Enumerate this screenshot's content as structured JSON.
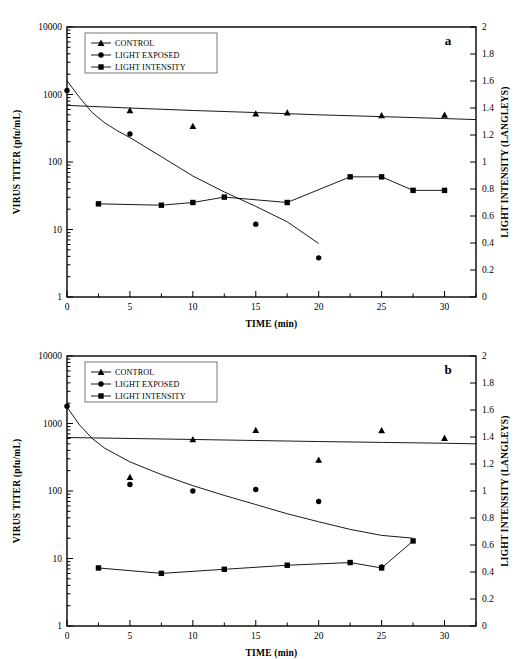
{
  "figure": {
    "panels": [
      {
        "id": "a",
        "letter": "a",
        "x_axis": {
          "title": "TIME (min)",
          "ticks": [
            0,
            5,
            10,
            15,
            20,
            25,
            30
          ],
          "min": 0,
          "max": 32.5,
          "minor_step": 2.5
        },
        "y_axis_left": {
          "title": "VIRUS TITER (pfu/mL)",
          "scale": "log",
          "ticks": [
            1,
            10,
            100,
            1000,
            10000
          ],
          "tick_labels": [
            "1",
            "10",
            "100",
            "1000",
            "10000"
          ],
          "min": 1,
          "max": 10000
        },
        "y_axis_right": {
          "title": "LIGHT INTENSITY (LANGLEYS)",
          "scale": "linear",
          "ticks": [
            0,
            0.2,
            0.4,
            0.6,
            0.8,
            1,
            1.2,
            1.4,
            1.6,
            1.8,
            2
          ],
          "tick_labels": [
            "0",
            "0.2",
            "0.4",
            "0.6",
            "0.8",
            "1",
            "1.2",
            "1.4",
            "1.6",
            "1.8",
            "2"
          ],
          "min": 0,
          "max": 2
        },
        "legend": {
          "entries": [
            {
              "label": "CONTROL",
              "marker": "triangle"
            },
            {
              "label": "LIGHT EXPOSED",
              "marker": "circle"
            },
            {
              "label": "LIGHT INTENSITY",
              "marker": "square"
            }
          ]
        }
      },
      {
        "id": "b",
        "letter": "b",
        "x_axis": {
          "title": "TIME (min)",
          "ticks": [
            0,
            5,
            10,
            15,
            20,
            25,
            30
          ],
          "min": 0,
          "max": 32.5,
          "minor_step": 2.5
        },
        "y_axis_left": {
          "title": "VIRUS TITER (pfu/mL)",
          "scale": "log",
          "ticks": [
            1,
            10,
            100,
            1000,
            10000
          ],
          "tick_labels": [
            "1",
            "10",
            "100",
            "1000",
            "10000"
          ],
          "min": 1,
          "max": 10000
        },
        "y_axis_right": {
          "title": "LIGHT INTENSITY (LANGLEYS)",
          "scale": "linear",
          "ticks": [
            0,
            0.2,
            0.4,
            0.6,
            0.8,
            1,
            1.2,
            1.4,
            1.6,
            1.8,
            2
          ],
          "tick_labels": [
            "0",
            "0.2",
            "0.4",
            "0.6",
            "0.8",
            "1",
            "1.2",
            "1.4",
            "1.6",
            "1.8",
            "2"
          ],
          "min": 0,
          "max": 2
        },
        "legend": {
          "entries": [
            {
              "label": "CONTROL",
              "marker": "triangle"
            },
            {
              "label": "LIGHT EXPOSED",
              "marker": "circle"
            },
            {
              "label": "LIGHT INTENSITY",
              "marker": "square"
            }
          ]
        }
      }
    ]
  },
  "chart_data": [
    {
      "type": "scatter",
      "panel": "a",
      "title": "",
      "xlabel": "TIME (min)",
      "ylabel": "VIRUS TITER (pfu/mL)",
      "ylabel_right": "LIGHT INTENSITY (LANGLEYS)",
      "xlim": [
        0,
        32.5
      ],
      "ylim": [
        1,
        10000
      ],
      "ylim_right": [
        0,
        2
      ],
      "yscale": "log",
      "grid": false,
      "legend_position": "top-left",
      "series": [
        {
          "name": "CONTROL",
          "marker": "triangle",
          "axis": "left",
          "line": false,
          "x": [
            5,
            10,
            15,
            17.5,
            25,
            30
          ],
          "y": [
            580,
            340,
            520,
            540,
            490,
            500
          ]
        },
        {
          "name": "LIGHT EXPOSED",
          "marker": "circle",
          "axis": "left",
          "line": false,
          "x": [
            0,
            5,
            15,
            20
          ],
          "y": [
            1150,
            260,
            12,
            3.8
          ]
        },
        {
          "name": "LIGHT INTENSITY",
          "marker": "square",
          "axis": "right",
          "line": true,
          "x": [
            2.5,
            7.5,
            10,
            12.5,
            17.5,
            22.5,
            25,
            27.5,
            30
          ],
          "y": [
            0.69,
            0.68,
            0.7,
            0.74,
            0.7,
            0.89,
            0.89,
            0.79,
            0.79
          ]
        },
        {
          "name": "CONTROL TREND LINE",
          "marker": "none",
          "axis": "left",
          "line": true,
          "x": [
            0,
            5,
            10,
            15,
            20,
            25,
            30,
            32.5
          ],
          "y": [
            690,
            630,
            580,
            540,
            500,
            470,
            440,
            425
          ]
        },
        {
          "name": "LIGHT EXPOSED DECAY CURVE",
          "marker": "none",
          "axis": "left",
          "line": true,
          "x": [
            0,
            1,
            2,
            3,
            4,
            5,
            7.5,
            10,
            12.5,
            15,
            17.5,
            20
          ],
          "y": [
            1600,
            900,
            540,
            380,
            290,
            230,
            120,
            62,
            36,
            22,
            13,
            6.2
          ]
        }
      ]
    },
    {
      "type": "scatter",
      "panel": "b",
      "title": "",
      "xlabel": "TIME (min)",
      "ylabel": "VIRUS TITER (pfu/mL)",
      "ylabel_right": "LIGHT INTENSITY (LANGLEYS)",
      "xlim": [
        0,
        32.5
      ],
      "ylim": [
        1,
        10000
      ],
      "ylim_right": [
        0,
        2
      ],
      "yscale": "log",
      "grid": false,
      "legend_position": "top-left",
      "series": [
        {
          "name": "CONTROL",
          "marker": "triangle",
          "axis": "left",
          "line": false,
          "x": [
            5,
            10,
            15,
            20,
            25,
            30
          ],
          "y": [
            160,
            580,
            800,
            290,
            790,
            610
          ]
        },
        {
          "name": "LIGHT EXPOSED",
          "marker": "circle",
          "axis": "left",
          "line": false,
          "x": [
            0,
            5,
            10,
            15,
            20,
            25
          ],
          "y": [
            1800,
            125,
            100,
            105,
            70,
            7.5
          ]
        },
        {
          "name": "LIGHT INTENSITY",
          "marker": "square",
          "axis": "right",
          "line": true,
          "x": [
            2.5,
            7.5,
            12.5,
            17.5,
            22.5,
            25,
            27.5
          ],
          "y": [
            0.43,
            0.39,
            0.42,
            0.45,
            0.47,
            0.43,
            0.63
          ]
        },
        {
          "name": "CONTROL TREND LINE",
          "marker": "none",
          "axis": "left",
          "line": true,
          "x": [
            0,
            5,
            10,
            15,
            20,
            25,
            30,
            32.5
          ],
          "y": [
            620,
            600,
            580,
            560,
            540,
            525,
            510,
            500
          ]
        },
        {
          "name": "LIGHT EXPOSED DECAY CURVE",
          "marker": "none",
          "axis": "left",
          "line": true,
          "x": [
            0,
            1,
            2,
            3,
            5,
            7.5,
            10,
            12.5,
            15,
            17.5,
            20,
            22.5,
            25,
            27.5
          ],
          "y": [
            1750,
            950,
            600,
            430,
            270,
            175,
            120,
            86,
            63,
            46,
            35,
            27,
            22,
            20
          ]
        }
      ]
    }
  ]
}
